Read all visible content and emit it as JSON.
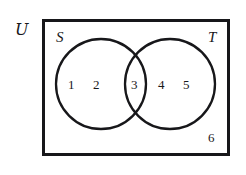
{
  "diagram": {
    "type": "venn-two-set",
    "title_visible": false,
    "universe": {
      "symbol": "ᵋ0",
      "label": "U",
      "position": "outside-top-left"
    },
    "sets": [
      {
        "id": "S",
        "label": "S",
        "position": "top-left-inside"
      },
      {
        "id": "T",
        "label": "T",
        "position": "top-right-inside"
      }
    ],
    "regions": [
      {
        "id": "s-only",
        "name": "S only",
        "elements": [
          "1",
          "2"
        ]
      },
      {
        "id": "intersection",
        "name": "S and T",
        "elements": [
          "3"
        ]
      },
      {
        "id": "t-only",
        "name": "T only",
        "elements": [
          "4",
          "5"
        ]
      },
      {
        "id": "outside",
        "name": "Universe outside",
        "elements": [
          "6"
        ]
      }
    ],
    "elements": {
      "e1": "1",
      "e2": "2",
      "e3": "3",
      "e4": "4",
      "e5": "5",
      "e6": "6"
    },
    "colors": {
      "stroke": "#17171a",
      "background": "#ffffff",
      "text": "#18181b"
    },
    "geometry": {
      "rect": {
        "x": 42,
        "y": 19,
        "width": 187,
        "height": 136,
        "stroke_width": 3
      },
      "circle_left": {
        "cx": 101,
        "cy": 84,
        "r": 45,
        "stroke_width": 2.2
      },
      "circle_right": {
        "cx": 170,
        "cy": 84,
        "r": 45,
        "stroke_width": 2.2
      }
    }
  }
}
